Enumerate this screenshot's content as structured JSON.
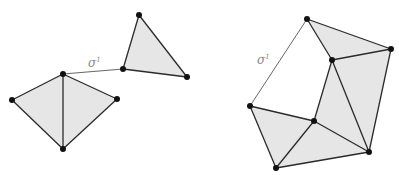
{
  "figure": {
    "left_complex": {
      "label": "σ",
      "label_superscript": "1",
      "vertices": {
        "a": [
          63,
          74
        ],
        "b": [
          12,
          100
        ],
        "c": [
          117,
          99
        ],
        "d": [
          63,
          149
        ],
        "e": [
          123,
          69
        ],
        "f": [
          139,
          15
        ],
        "g": [
          187,
          77
        ]
      },
      "filled_triangles": [
        [
          "a",
          "b",
          "d"
        ],
        [
          "a",
          "c",
          "d"
        ],
        [
          "e",
          "f",
          "g"
        ]
      ],
      "edges": [
        [
          "a",
          "b"
        ],
        [
          "b",
          "d"
        ],
        [
          "a",
          "d"
        ],
        [
          "a",
          "c"
        ],
        [
          "c",
          "d"
        ],
        [
          "e",
          "f"
        ],
        [
          "f",
          "g"
        ],
        [
          "e",
          "g"
        ]
      ],
      "free_edges": [
        [
          "a",
          "e"
        ]
      ]
    },
    "right_complex": {
      "label": "σ",
      "label_superscript": "1",
      "vertices": {
        "p": [
          307,
          19
        ],
        "q": [
          391,
          49
        ],
        "r": [
          332,
          60
        ],
        "s": [
          250,
          106
        ],
        "t": [
          314,
          121
        ],
        "u": [
          369,
          152
        ],
        "v": [
          276,
          168
        ]
      },
      "filled_triangles": [
        [
          "p",
          "q",
          "r"
        ],
        [
          "r",
          "q",
          "u"
        ],
        [
          "r",
          "t",
          "u"
        ],
        [
          "s",
          "t",
          "v"
        ],
        [
          "t",
          "u",
          "v"
        ]
      ],
      "edges": [
        [
          "p",
          "q"
        ],
        [
          "p",
          "r"
        ],
        [
          "q",
          "r"
        ],
        [
          "q",
          "u"
        ],
        [
          "r",
          "u"
        ],
        [
          "r",
          "t"
        ],
        [
          "t",
          "u"
        ],
        [
          "s",
          "t"
        ],
        [
          "s",
          "v"
        ],
        [
          "t",
          "v"
        ],
        [
          "u",
          "v"
        ]
      ],
      "free_edges": [
        [
          "p",
          "s"
        ]
      ]
    },
    "colors": {
      "fill": "#e6e6e6",
      "edge": "#2a2a2a",
      "vertex": "#111111",
      "label": "#8a8a8a"
    }
  }
}
